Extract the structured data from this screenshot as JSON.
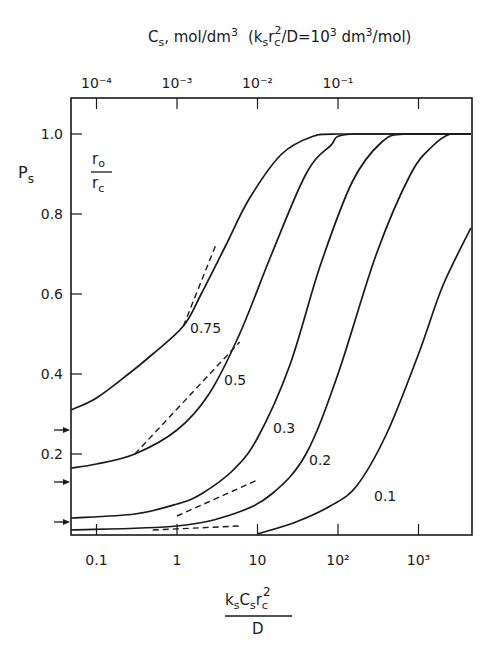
{
  "chart_data": {
    "type": "line",
    "title": "",
    "xscale": "log",
    "xlabel": "k_s C_s r_c^2 / D",
    "xlabel_parts": {
      "numerator": "ksCsrc2",
      "denominator": "D"
    },
    "ylabel": "P_s",
    "xlim": [
      0.047,
      4470
    ],
    "ylim": [
      0,
      1.0
    ],
    "x_ticks": [
      {
        "value": 0.1,
        "label": "0.1"
      },
      {
        "value": 1,
        "label": "1"
      },
      {
        "value": 10,
        "label": "10"
      },
      {
        "value": 100,
        "label": "10²"
      },
      {
        "value": 1000,
        "label": "10³"
      }
    ],
    "y_ticks": [
      {
        "value": 0.2,
        "label": "0.2"
      },
      {
        "value": 0.4,
        "label": "0.4"
      },
      {
        "value": 0.6,
        "label": "0.6"
      },
      {
        "value": 0.8,
        "label": "0.8"
      },
      {
        "value": 1.0,
        "label": "1.0"
      }
    ],
    "top_axis": {
      "label": "C_s , mol/dm³  (k_s r_c²/D = 10³ dm³/mol)",
      "ticks": [
        {
          "value": 0.1,
          "label": "10⁻⁴"
        },
        {
          "value": 1,
          "label": "10⁻³"
        },
        {
          "value": 10,
          "label": "10⁻²"
        },
        {
          "value": 100,
          "label": "10⁻¹"
        },
        {
          "value": 1000,
          "label": ""
        }
      ]
    },
    "legend_title": "r_o / r_c",
    "series": [
      {
        "name": "0.75",
        "x": [
          0.047,
          0.1,
          0.25,
          0.5,
          1.2,
          2,
          4,
          8,
          20,
          50,
          100,
          4470
        ],
        "y": [
          0.31,
          0.34,
          0.4,
          0.45,
          0.52,
          0.6,
          0.72,
          0.84,
          0.95,
          0.995,
          1.0,
          1.0
        ]
      },
      {
        "name": "0.5",
        "x": [
          0.047,
          0.1,
          0.3,
          1,
          2.5,
          6,
          15,
          40,
          80,
          150,
          4470
        ],
        "y": [
          0.165,
          0.175,
          0.2,
          0.26,
          0.35,
          0.5,
          0.7,
          0.9,
          0.97,
          1.0,
          1.0
        ]
      },
      {
        "name": "0.3",
        "x": [
          0.047,
          0.3,
          1,
          2,
          5,
          10,
          25,
          60,
          150,
          350,
          700,
          4470
        ],
        "y": [
          0.04,
          0.05,
          0.075,
          0.1,
          0.16,
          0.24,
          0.42,
          0.67,
          0.88,
          0.98,
          1.0,
          1.0
        ]
      },
      {
        "name": "0.2",
        "x": [
          0.047,
          1,
          5,
          15,
          40,
          100,
          300,
          800,
          1500,
          2500,
          4470
        ],
        "y": [
          0.01,
          0.02,
          0.05,
          0.1,
          0.2,
          0.4,
          0.7,
          0.9,
          0.97,
          1.0,
          1.0
        ]
      },
      {
        "name": "0.1",
        "x": [
          10,
          30,
          80,
          170,
          400,
          1000,
          2000,
          4470
        ],
        "y": [
          0.0,
          0.03,
          0.07,
          0.12,
          0.25,
          0.45,
          0.62,
          0.765
        ]
      }
    ],
    "asymptotes_dashed": [
      {
        "for": "0.75",
        "x": [
          1.2,
          3
        ],
        "y": [
          0.52,
          0.72
        ]
      },
      {
        "for": "0.5",
        "x": [
          0.3,
          6
        ],
        "y": [
          0.2,
          0.48
        ]
      },
      {
        "for": "0.3",
        "x": [
          1,
          10
        ],
        "y": [
          0.045,
          0.135
        ]
      },
      {
        "for": "0.2",
        "x": [
          0.5,
          6
        ],
        "y": [
          0.01,
          0.02
        ]
      }
    ],
    "arrows_left_axis": [
      0.26,
      0.13,
      0.03
    ],
    "grid": false,
    "legend_position": "inline curve labels"
  },
  "labels": {
    "y_axis": "P",
    "y_axis_sub": "s",
    "legend_num": "r",
    "legend_num_sub": "o",
    "legend_den": "r",
    "legend_den_sub": "c",
    "top_title_main": "C",
    "top_title_sub": "s",
    "top_title_rest": ", mol/dm",
    "top_title_sup": "3",
    "top_title_paren": "(k",
    "top_title_paren2": "r",
    "top_title_paren3": "/D=10",
    "top_title_paren4": " dm",
    "top_title_paren5": "/mol)",
    "x_num_k": "k",
    "x_num_s1": "s",
    "x_num_C": "C",
    "x_num_s2": "s",
    "x_num_r": "r",
    "x_num_c": "c",
    "x_num_2": "2",
    "x_den": "D"
  }
}
